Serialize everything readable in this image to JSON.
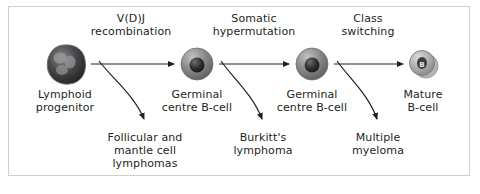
{
  "figure": {
    "background_color": "#ffffff",
    "frame_color": "#cfcfcf",
    "text_color": "#231f20"
  },
  "cells": [
    {
      "id": "lymphoid-progenitor",
      "label": "Lymphoid\nprogenitor",
      "inner_text": "",
      "x": 65,
      "y": 64,
      "radius": 19,
      "style": "irregular-dark-multilobed",
      "fill": "#4d4d4f",
      "nucleus_fill": "#1a1a1a"
    },
    {
      "id": "germinal-centre-b-cell-1",
      "label": "Germinal\ncentre B-cell",
      "inner_text": "",
      "x": 197,
      "y": 64,
      "radius": 16,
      "style": "round-grey-dark-nucleus",
      "fill": "#8a8a8c",
      "nucleus_fill": "#2b2b2b"
    },
    {
      "id": "germinal-centre-b-cell-2",
      "label": "Germinal\ncentre B-cell",
      "inner_text": "",
      "x": 312,
      "y": 64,
      "radius": 16,
      "style": "round-grey-dark-nucleus",
      "fill": "#8a8a8c",
      "nucleus_fill": "#2b2b2b"
    },
    {
      "id": "mature-b-cell",
      "label": "Mature\nB-cell",
      "inner_text": "B",
      "x": 423,
      "y": 64,
      "radius": 13,
      "style": "round-light-grey-labelled",
      "fill": "#b3b3b3",
      "nucleus_fill": "#3a3a3a"
    }
  ],
  "processes": [
    {
      "id": "vdj-recombination",
      "label": "V(D)J\nrecombination",
      "x": 131,
      "y": 12
    },
    {
      "id": "somatic-hypermutation",
      "label": "Somatic\nhypermutation",
      "x": 254,
      "y": 12
    },
    {
      "id": "class-switching",
      "label": "Class\nswitching",
      "x": 368,
      "y": 12
    }
  ],
  "diseases": [
    {
      "id": "follicular-mantle-cell-lymphomas",
      "label": "Follicular and\nmantle cell\nlymphomas",
      "x": 145,
      "y": 133
    },
    {
      "id": "burkitts-lymphoma",
      "label": "Burkitt's\nlymphoma",
      "x": 263,
      "y": 133
    },
    {
      "id": "multiple-myeloma",
      "label": "Multiple\nmyeloma",
      "x": 378,
      "y": 133
    }
  ],
  "arrows": {
    "stroke_color": "#231f20",
    "straight": [
      {
        "id": "arrow-progenitor-to-gc1",
        "x1": 91,
        "y1": 64,
        "x2": 176,
        "y2": 64
      },
      {
        "id": "arrow-gc1-to-gc2",
        "x1": 219,
        "y1": 64,
        "x2": 291,
        "y2": 64
      },
      {
        "id": "arrow-gc2-to-mature",
        "x1": 334,
        "y1": 64,
        "x2": 405,
        "y2": 64
      }
    ],
    "curved": [
      {
        "id": "branch-to-follicular-mantle",
        "start_x": 100,
        "start_y": 62,
        "end_x": 145,
        "end_y": 124
      },
      {
        "id": "branch-to-burkitts",
        "start_x": 222,
        "start_y": 62,
        "end_x": 263,
        "end_y": 124
      },
      {
        "id": "branch-to-multiple-myeloma",
        "start_x": 338,
        "start_y": 62,
        "end_x": 378,
        "end_y": 124
      }
    ]
  }
}
